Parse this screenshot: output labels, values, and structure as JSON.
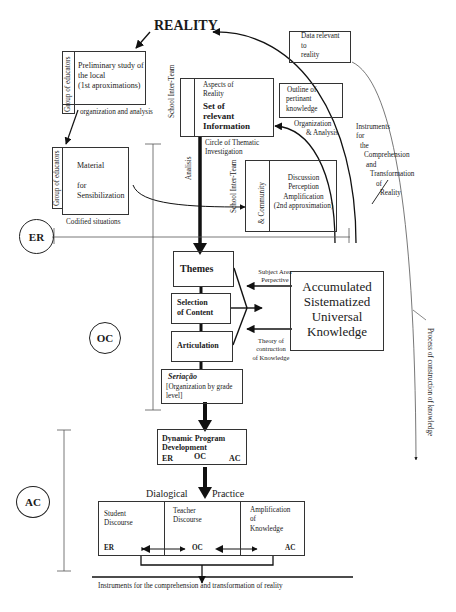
{
  "title": "REALITY",
  "top_left": {
    "group_label": "Group of educators",
    "preliminary_study": [
      "Preliminary study of",
      "the local",
      "(1st aproximations)"
    ],
    "org_analysis": "organization and analysis"
  },
  "sensibilization": {
    "group_label": "Group of educators",
    "lines": [
      "Material",
      "for",
      "Sensibilization"
    ],
    "caption": "Codified situations"
  },
  "school_inter_team_1": "School Inter-Team",
  "relevant_info": {
    "aspects": [
      "Aspects of",
      "Reality"
    ],
    "title": [
      "Set of",
      "relevant",
      "Information"
    ]
  },
  "circle_thematic": [
    "Circle of Thematic",
    "Investigation"
  ],
  "analysis_label": "Analisis",
  "data_relevant": [
    "Data relevant",
    "to",
    "reality"
  ],
  "outline": [
    "Outline of",
    "pertinant",
    "knowledge"
  ],
  "org_analysis_2": [
    "Organization",
    "& Analysis"
  ],
  "instruments_arc": [
    "Instruments",
    "for",
    "the",
    "Comprehension",
    "and",
    "Transformation",
    "of",
    "Reality"
  ],
  "discussion": {
    "side_label_1": "School Inter-Team",
    "side_label_2": "& Community",
    "lines": [
      "Discussion",
      "Perception",
      "Amplification",
      "(2nd approximation)"
    ]
  },
  "stages": {
    "er": "ER",
    "oc": "OC",
    "ac": "AC"
  },
  "program": {
    "themes": "Themes",
    "selection": [
      "Selection",
      "of Content"
    ],
    "articulation": "Articulation",
    "seriacao_title": "Seriação",
    "seriacao_note": [
      "[Organization by grade",
      "level]"
    ]
  },
  "knowledge": {
    "lines": [
      "Accumulated",
      "Sistematized",
      "Universal",
      "Knowledge"
    ],
    "subject_area": [
      "Subject Area",
      "Perpective"
    ],
    "theory": [
      "Theory of",
      "contruction",
      "of Knowledge"
    ]
  },
  "process_label": "Process of construction of knowledge",
  "dynamic": {
    "lines": [
      "Dynamic Program",
      "Development"
    ],
    "er": "ER",
    "oc": "OC",
    "ac": "AC"
  },
  "dialogical": {
    "left": "Dialogical",
    "right": "Practice"
  },
  "discourse": {
    "student": [
      "Student",
      "Discourse"
    ],
    "teacher": [
      "Teacher",
      "Discourse"
    ],
    "amplification": [
      "Amplification",
      "of",
      "Knowledge"
    ],
    "er": "ER",
    "oc": "OC",
    "ac": "AC"
  },
  "bottom_caption": "Instruments for the comprehension and transformation of reality"
}
